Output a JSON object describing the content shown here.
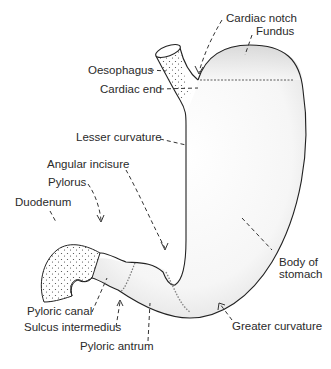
{
  "diagram": {
    "colors": {
      "outline": "#222222",
      "fill_light": "#ffffff",
      "fill_shade": "#d9d9d9",
      "label_text": "#2a2a2a",
      "stipple": "#444444"
    },
    "labels": {
      "cardiac_notch": "Cardiac notch",
      "fundus": "Fundus",
      "oesophagus": "Oesophagus",
      "cardiac_end": "Cardiac end",
      "lesser_curvature": "Lesser curvature",
      "angular_incisure": "Angular incisure",
      "pylorus": "Pylorus",
      "duodenum": "Duodenum",
      "body_of_stomach_line1": "Body of",
      "body_of_stomach_line2": "stomach",
      "pyloric_canal": "Pyloric canal",
      "sulcus_intermedius": "Sulcus intermedius",
      "pyloric_antrum": "Pyloric antrum",
      "greater_curvature": "Greater curvature"
    }
  }
}
